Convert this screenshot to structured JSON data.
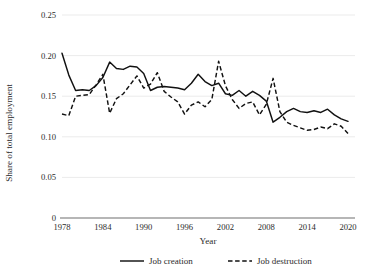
{
  "chart_data": {
    "type": "line",
    "title": "",
    "xlabel": "Year",
    "ylabel": "Share of total employment",
    "xlim": [
      1978,
      2020
    ],
    "ylim": [
      0,
      0.25
    ],
    "grid": true,
    "legend_position": "bottom",
    "y_ticks": [
      "0",
      "0.05",
      "0.10",
      "0.15",
      "0.20",
      "0.25"
    ],
    "y_tick_values": [
      0,
      0.05,
      0.1,
      0.15,
      0.2,
      0.25
    ],
    "x_ticks": [
      "1978",
      "1984",
      "1990",
      "1996",
      "2002",
      "2008",
      "2014",
      "2020"
    ],
    "x_tick_values": [
      1978,
      1984,
      1990,
      1996,
      2002,
      2008,
      2014,
      2020
    ],
    "x": [
      1978,
      1979,
      1980,
      1981,
      1982,
      1983,
      1984,
      1985,
      1986,
      1987,
      1988,
      1989,
      1990,
      1991,
      1992,
      1993,
      1994,
      1995,
      1996,
      1997,
      1998,
      1999,
      2000,
      2001,
      2002,
      2003,
      2004,
      2005,
      2006,
      2007,
      2008,
      2009,
      2010,
      2011,
      2012,
      2013,
      2014,
      2015,
      2016,
      2017,
      2018,
      2019,
      2020
    ],
    "series": [
      {
        "name": "Job creation",
        "style": "solid",
        "color": "#111111",
        "values": [
          0.203,
          0.176,
          0.157,
          0.158,
          0.157,
          0.163,
          0.173,
          0.192,
          0.184,
          0.183,
          0.187,
          0.186,
          0.178,
          0.157,
          0.161,
          0.162,
          0.161,
          0.16,
          0.158,
          0.166,
          0.177,
          0.168,
          0.163,
          0.166,
          0.153,
          0.151,
          0.157,
          0.15,
          0.156,
          0.151,
          0.144,
          0.118,
          0.124,
          0.131,
          0.135,
          0.131,
          0.13,
          0.132,
          0.13,
          0.134,
          0.127,
          0.122,
          0.119
        ]
      },
      {
        "name": "Job destruction",
        "style": "dashed",
        "color": "#111111",
        "values": [
          0.128,
          0.126,
          0.15,
          0.151,
          0.152,
          0.164,
          0.177,
          0.129,
          0.147,
          0.153,
          0.164,
          0.175,
          0.16,
          0.165,
          0.179,
          0.156,
          0.149,
          0.143,
          0.128,
          0.139,
          0.143,
          0.137,
          0.146,
          0.193,
          0.163,
          0.146,
          0.135,
          0.141,
          0.143,
          0.127,
          0.14,
          0.172,
          0.131,
          0.118,
          0.114,
          0.111,
          0.108,
          0.109,
          0.112,
          0.11,
          0.116,
          0.113,
          0.104
        ]
      }
    ]
  },
  "legend": {
    "items": [
      {
        "label": "Job creation",
        "style": "solid"
      },
      {
        "label": "Job destruction",
        "style": "dashed"
      }
    ]
  }
}
